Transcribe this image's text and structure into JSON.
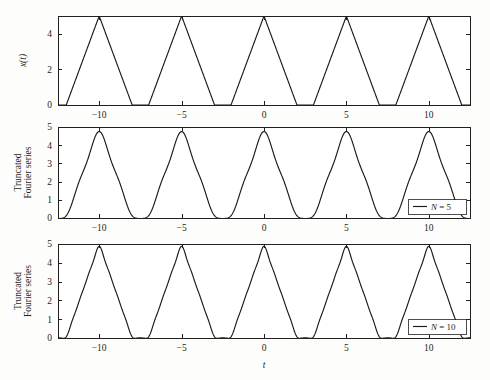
{
  "figure": {
    "width": 490,
    "height": 380,
    "background": "#fdfdfc",
    "line_color": "#1a1a1a",
    "axis_color": "#231f20"
  },
  "chart_data": [
    {
      "type": "line",
      "panel_index": 0,
      "title": "",
      "xlabel": "",
      "ylabel": "x(t)",
      "ylabel_style": "italic",
      "xlim": [
        -12.5,
        12.5
      ],
      "ylim": [
        0,
        5
      ],
      "xticks": [
        -10,
        -5,
        0,
        5,
        10
      ],
      "xtick_labels": [
        "-10",
        "-5",
        "0",
        "5",
        "10"
      ],
      "yticks": [
        0,
        2,
        4
      ],
      "ytick_labels": [
        "0",
        "2",
        "4"
      ],
      "grid": false,
      "legend": null,
      "series": [
        {
          "name": "x(t)",
          "waveform": "triangle",
          "period": 5,
          "amplitude": 5,
          "peak_offset": 0,
          "rise_fraction": 0.5,
          "duty_fraction": 0.8,
          "description": "Periodic triangular pulse train, peak value 5 at t = 0, +/-5, +/-10; zero baseline between pulses"
        }
      ]
    },
    {
      "type": "line",
      "panel_index": 1,
      "title": "",
      "xlabel": "",
      "ylabel": "Truncated\nFourier series",
      "ylabel_style": "normal",
      "xlim": [
        -12.5,
        12.5
      ],
      "ylim": [
        0,
        5
      ],
      "xticks": [
        -10,
        -5,
        0,
        5,
        10
      ],
      "xtick_labels": [
        "-10",
        "-5",
        "0",
        "5",
        "10"
      ],
      "yticks": [
        0,
        1,
        2,
        3,
        4,
        5
      ],
      "ytick_labels": [
        "0",
        "1",
        "2",
        "3",
        "4",
        "5"
      ],
      "grid": false,
      "legend": {
        "position": "lower right",
        "entries": [
          {
            "label": "N = 5"
          }
        ]
      },
      "series": [
        {
          "name": "N = 5",
          "waveform": "fourier-truncated-triangle",
          "harmonics": 5,
          "period": 5,
          "amplitude": 5,
          "description": "Fourier series of the triangular pulse train truncated at N = 5; smooth rounded peaks and troughs"
        }
      ]
    },
    {
      "type": "line",
      "panel_index": 2,
      "title": "",
      "xlabel": "t",
      "xlabel_style": "italic",
      "ylabel": "Truncated\nFourier series",
      "ylabel_style": "normal",
      "xlim": [
        -12.5,
        12.5
      ],
      "ylim": [
        0,
        5
      ],
      "xticks": [
        -10,
        -5,
        0,
        5,
        10
      ],
      "xtick_labels": [
        "-10",
        "-5",
        "0",
        "5",
        "10"
      ],
      "yticks": [
        0,
        1,
        2,
        3,
        4,
        5
      ],
      "ytick_labels": [
        "0",
        "1",
        "2",
        "3",
        "4",
        "5"
      ],
      "grid": false,
      "legend": {
        "position": "lower right",
        "entries": [
          {
            "label": "N = 10"
          }
        ]
      },
      "series": [
        {
          "name": "N = 10",
          "waveform": "fourier-truncated-triangle",
          "harmonics": 10,
          "period": 5,
          "amplitude": 5,
          "description": "Fourier series of the triangular pulse train truncated at N = 10; nearly sharp triangular peaks"
        }
      ]
    }
  ],
  "panels": [
    {
      "id": "panel-signal",
      "left": 58,
      "top": 16,
      "width": 412,
      "height": 89
    },
    {
      "id": "panel-fourier-n5",
      "left": 58,
      "top": 127,
      "width": 412,
      "height": 91
    },
    {
      "id": "panel-fourier-n10",
      "left": 58,
      "top": 244,
      "width": 412,
      "height": 94
    }
  ],
  "labels": {
    "xaxis": "t",
    "ylabel_panel1": "x(t)",
    "ylabel_panel2_line1": "Truncated",
    "ylabel_panel2_line2": "Fourier series",
    "ylabel_panel3_line1": "Truncated",
    "ylabel_panel3_line2": "Fourier series",
    "legend_n5": "N = 5",
    "legend_n10": "N = 10"
  }
}
